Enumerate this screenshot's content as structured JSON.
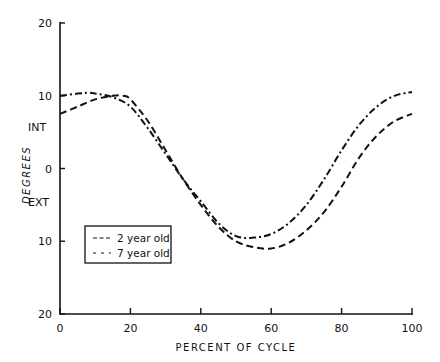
{
  "chart_data": {
    "type": "line",
    "title": "",
    "xlabel": "PERCENT OF CYCLE",
    "ylabel": "DEGREES",
    "xlim": [
      0,
      100
    ],
    "ylim": [
      -20,
      20
    ],
    "x_ticks": [
      "0",
      "20",
      "40",
      "60",
      "80",
      "100"
    ],
    "y_ticks": [
      "20",
      "10",
      "0",
      "10",
      "20"
    ],
    "y_tick_values": [
      20,
      10,
      0,
      -10,
      -20
    ],
    "y_annotations": [
      {
        "text": "INT",
        "meaning": "internal rotation (positive)"
      },
      {
        "text": "EXT",
        "meaning": "external rotation (negative)"
      }
    ],
    "grid": false,
    "legend_position": "lower-left inside",
    "series_assignment_note": "Style-to-series mapping is inferred from legend glyphs; line styles are hard to distinguish at this resolution and the mapping may be swapped.",
    "series": [
      {
        "name": "2 year old",
        "style": "dashed",
        "x": [
          0,
          5,
          10,
          15,
          18,
          20,
          25,
          30,
          35,
          40,
          45,
          50,
          55,
          60,
          65,
          70,
          75,
          80,
          85,
          90,
          95,
          100
        ],
        "values": [
          7.5,
          8.5,
          9.5,
          10.0,
          10.0,
          9.5,
          6.5,
          2.5,
          -1.5,
          -5,
          -8,
          -10,
          -10.8,
          -11,
          -10.2,
          -8.5,
          -6,
          -2.5,
          1.5,
          4.5,
          6.5,
          7.5
        ]
      },
      {
        "name": "7 year old",
        "style": "dash-dot",
        "x": [
          0,
          5,
          8,
          10,
          15,
          20,
          25,
          30,
          35,
          40,
          45,
          50,
          55,
          60,
          65,
          70,
          75,
          80,
          85,
          90,
          95,
          100
        ],
        "values": [
          10,
          10.3,
          10.4,
          10.3,
          9.8,
          8.5,
          5.5,
          2,
          -1.5,
          -4.5,
          -7.5,
          -9.3,
          -9.5,
          -9,
          -7.5,
          -5,
          -1.5,
          2.5,
          6,
          8.5,
          10,
          10.5
        ]
      }
    ]
  },
  "legend": {
    "items": [
      {
        "glyph": "- - -",
        "label": "2 year old"
      },
      {
        "glyph": "— —",
        "label": "7 year old"
      }
    ]
  },
  "axes": {
    "x_title": "PERCENT OF CYCLE",
    "y_title": "DEGREES",
    "int_label": "INT",
    "ext_label": "EXT",
    "x_tick_labels": [
      "0",
      "20",
      "40",
      "60",
      "80",
      "100"
    ],
    "y_tick_labels": [
      "20",
      "10",
      "0",
      "10",
      "20"
    ]
  }
}
